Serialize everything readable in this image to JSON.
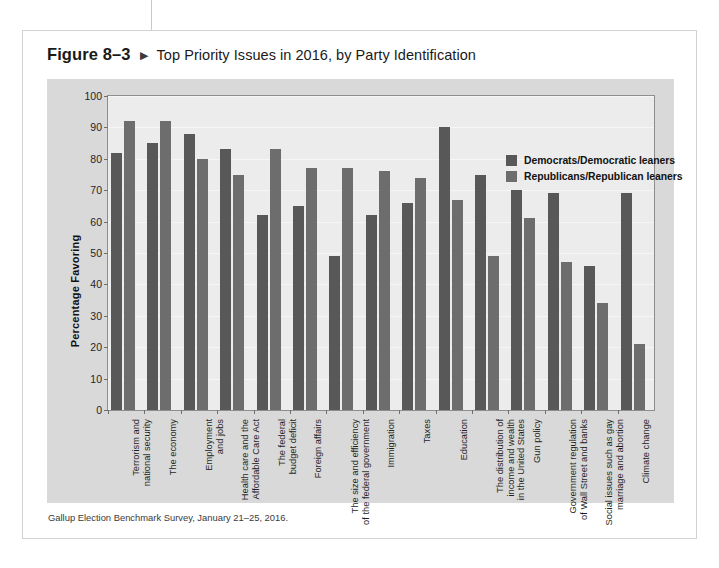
{
  "figure": {
    "number": "Figure 8–3",
    "marker": "▶",
    "title": "Top Priority Issues in 2016, by Party Identification",
    "source": "Gallup Election Benchmark Survey, January 21–25, 2016."
  },
  "colors": {
    "democrat_bar": "#585858",
    "republican_bar": "#6d6d6d",
    "panel_background": "#d9d9d9",
    "plot_background": "#ececec",
    "card_background": "#ffffff",
    "axis": "#8e8e8e",
    "gridline": "#f6f6f6",
    "text": "#1a1a1a"
  },
  "legend": {
    "position": "top-right-inside-plot",
    "entries": [
      {
        "label": "Democrats/Democratic leaners",
        "color": "#585858"
      },
      {
        "label": "Republicans/Republican leaners",
        "color": "#6d6d6d"
      }
    ]
  },
  "chart_data": {
    "type": "bar",
    "title": "Top Priority Issues in 2016, by Party Identification",
    "xlabel": "",
    "ylabel": "Percentage Favoring",
    "ylim": [
      0,
      100
    ],
    "yticks": [
      0,
      10,
      20,
      30,
      40,
      50,
      60,
      70,
      80,
      90,
      100
    ],
    "ytick_labels": [
      "0",
      "10",
      "20",
      "30",
      "40",
      "50",
      "60",
      "70",
      "80",
      "90",
      "100"
    ],
    "grid": true,
    "legend_position": "upper right",
    "categories": [
      "Terrorism and\nnational security",
      "The economy",
      "Employment\nand jobs",
      "Health care and the\nAffordable Care Act",
      "The federal\nbudget deficit",
      "Foreign affairs",
      "The size and efficiency\nof the federal government",
      "Immigration",
      "Taxes",
      "Education",
      "The distribution of\nincome and wealth\nin the United States",
      "Gun policy",
      "Government regulation\nof Wall Street and banks",
      "Social issues such as gay\nmarriage and abortion",
      "Climate change"
    ],
    "series": [
      {
        "name": "Democrats/Democratic leaners",
        "color": "#585858",
        "values": [
          82,
          85,
          88,
          83,
          62,
          65,
          49,
          62,
          66,
          90,
          75,
          70,
          69,
          46,
          69
        ]
      },
      {
        "name": "Republicans/Republican leaners",
        "color": "#6d6d6d",
        "values": [
          92,
          92,
          80,
          75,
          83,
          77,
          77,
          76,
          74,
          67,
          49,
          61,
          47,
          34,
          21
        ]
      }
    ]
  }
}
